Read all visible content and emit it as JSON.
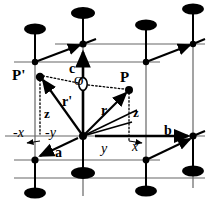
{
  "figure": {
    "type": "crystal-unit-cell-diagram",
    "background_color": "#ffffff",
    "ink_color": "#000000",
    "cell_line_color": "#555555"
  },
  "points": {
    "origin_label": "O",
    "point_p_label": "P",
    "point_p_prime_label": "P'"
  },
  "vectors": {
    "r": "r",
    "r_prime": "r'",
    "axis_a": "a",
    "axis_b": "b",
    "axis_c": "c"
  },
  "coordinates": {
    "z_right": "z",
    "z_left": "z",
    "y_positive": "y",
    "y_negative": "-y",
    "x_positive": "x",
    "x_negative": "-x"
  },
  "geometry": {
    "front_bottom_left": [
      18,
      160
    ],
    "front_bottom_right": [
      150,
      160
    ],
    "center_origin": [
      83,
      136
    ],
    "top_face_back_node": [
      83,
      44
    ],
    "atom_radius_x": 11,
    "atom_radius_y": 5.5,
    "point_p": [
      129,
      89
    ],
    "point_p_prime": [
      40,
      76
    ]
  },
  "atoms": {
    "count": 8,
    "shape": "filled-ellipse",
    "color": "#000000"
  }
}
